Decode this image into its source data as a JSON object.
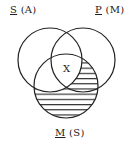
{
  "diagram": {
    "type": "venn-3",
    "circles": [
      {
        "id": "S",
        "term": "S",
        "alt": "(A)",
        "cx": 50,
        "cy": 60,
        "r": 32
      },
      {
        "id": "P",
        "term": "P",
        "alt": "(M)",
        "cx": 83,
        "cy": 60,
        "r": 32
      },
      {
        "id": "M",
        "term": "M",
        "alt": "(S)",
        "cx": 66,
        "cy": 86,
        "r": 32
      }
    ],
    "labels": {
      "s": {
        "term": "S",
        "alt": "(A)"
      },
      "p": {
        "term": "P",
        "alt": "(M)"
      },
      "m": {
        "term": "M",
        "alt": "(S)"
      }
    },
    "marks": {
      "x": {
        "text": "X",
        "region": "S∩P∩M"
      }
    },
    "shaded_region": "M outside S",
    "colors": {
      "stroke": "#222222",
      "hatch": "#222222",
      "background": "#ffffff"
    }
  }
}
